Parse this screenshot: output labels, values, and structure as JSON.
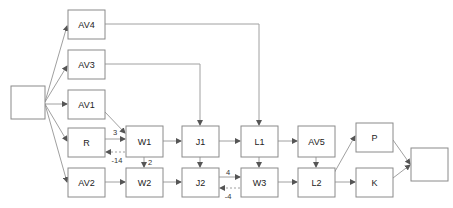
{
  "diagram": {
    "title": "",
    "canvas": {
      "width": 453,
      "height": 208
    },
    "style": {
      "box_fill": "#ffffff",
      "box_stroke": "#8a8a8a",
      "edge_stroke": "#a0a0a0",
      "label_color": "#222222",
      "edge_label_color": "#333333",
      "background": "#ffffff"
    },
    "nodes": [
      {
        "id": "SRC",
        "label": "",
        "x": 11,
        "y": 86,
        "w": 34,
        "h": 33
      },
      {
        "id": "AV4",
        "label": "AV4",
        "x": 68,
        "y": 10,
        "w": 37,
        "h": 29
      },
      {
        "id": "AV3",
        "label": "AV3",
        "x": 68,
        "y": 50,
        "w": 37,
        "h": 29
      },
      {
        "id": "AV1",
        "label": "AV1",
        "x": 68,
        "y": 90,
        "w": 37,
        "h": 29
      },
      {
        "id": "R",
        "label": "R",
        "x": 68,
        "y": 128,
        "w": 37,
        "h": 29
      },
      {
        "id": "AV2",
        "label": "AV2",
        "x": 68,
        "y": 168,
        "w": 37,
        "h": 29
      },
      {
        "id": "W1",
        "label": "W1",
        "x": 126,
        "y": 126,
        "w": 37,
        "h": 31
      },
      {
        "id": "W2",
        "label": "W2",
        "x": 126,
        "y": 168,
        "w": 37,
        "h": 29
      },
      {
        "id": "J1",
        "label": "J1",
        "x": 182,
        "y": 126,
        "w": 37,
        "h": 31
      },
      {
        "id": "J2",
        "label": "J2",
        "x": 182,
        "y": 168,
        "w": 37,
        "h": 29
      },
      {
        "id": "L1",
        "label": "L1",
        "x": 241,
        "y": 126,
        "w": 37,
        "h": 31
      },
      {
        "id": "W3",
        "label": "W3",
        "x": 241,
        "y": 168,
        "w": 37,
        "h": 29
      },
      {
        "id": "AV5",
        "label": "AV5",
        "x": 298,
        "y": 126,
        "w": 37,
        "h": 31
      },
      {
        "id": "L2",
        "label": "L2",
        "x": 298,
        "y": 168,
        "w": 37,
        "h": 29
      },
      {
        "id": "P",
        "label": "P",
        "x": 356,
        "y": 123,
        "w": 37,
        "h": 29
      },
      {
        "id": "K",
        "label": "K",
        "x": 356,
        "y": 168,
        "w": 37,
        "h": 29
      },
      {
        "id": "SINK",
        "label": "",
        "x": 411,
        "y": 148,
        "w": 37,
        "h": 33
      }
    ],
    "edges": [
      {
        "id": "e-src-av4",
        "from": "SRC",
        "to": "AV4",
        "label": "",
        "style": "solid",
        "points": "45,102 67,26"
      },
      {
        "id": "e-src-av3",
        "from": "SRC",
        "to": "AV3",
        "label": "",
        "style": "solid",
        "points": "45,102 67,66"
      },
      {
        "id": "e-src-av1",
        "from": "SRC",
        "to": "AV1",
        "label": "",
        "style": "solid",
        "points": "45,104 67,104"
      },
      {
        "id": "e-src-r",
        "from": "SRC",
        "to": "R",
        "label": "",
        "style": "solid",
        "points": "45,104 67,141"
      },
      {
        "id": "e-src-av2",
        "from": "SRC",
        "to": "AV2",
        "label": "",
        "style": "solid",
        "points": "45,104 67,182"
      },
      {
        "id": "e-av4-l1",
        "from": "AV4",
        "to": "L1",
        "label": "",
        "style": "solid",
        "points": "105,24 259,24 259,125"
      },
      {
        "id": "e-av3-j1",
        "from": "AV3",
        "to": "J1",
        "label": "",
        "style": "solid",
        "points": "105,64 200,64 200,125"
      },
      {
        "id": "e-av1-w1",
        "from": "AV1",
        "to": "W1",
        "label": "",
        "style": "solid",
        "points": "105,112 125,133"
      },
      {
        "id": "e-r-w1",
        "from": "R",
        "to": "W1",
        "label": "3",
        "style": "solid",
        "points": "105,139 125,139"
      },
      {
        "id": "e-w1-r",
        "from": "W1",
        "to": "R",
        "label": "-14",
        "style": "dashed",
        "points": "125,152 106,152"
      },
      {
        "id": "e-w1-w2",
        "from": "W1",
        "to": "W2",
        "label": "2",
        "style": "solid",
        "points": "144,157 144,167"
      },
      {
        "id": "e-av2-w2",
        "from": "AV2",
        "to": "W2",
        "label": "",
        "style": "solid",
        "points": "105,182 125,182"
      },
      {
        "id": "e-w1-j1",
        "from": "W1",
        "to": "J1",
        "label": "",
        "style": "solid",
        "points": "163,141 181,141"
      },
      {
        "id": "e-w2-j2",
        "from": "W2",
        "to": "J2",
        "label": "",
        "style": "solid",
        "points": "163,182 181,182"
      },
      {
        "id": "e-j1-j2",
        "from": "J1",
        "to": "J2",
        "label": "",
        "style": "solid",
        "points": "200,157 200,167"
      },
      {
        "id": "e-j1-l1",
        "from": "J1",
        "to": "L1",
        "label": "",
        "style": "solid",
        "points": "219,141 240,141"
      },
      {
        "id": "e-j2-w3",
        "from": "J2",
        "to": "W3",
        "label": "4",
        "style": "solid",
        "points": "219,177 240,177"
      },
      {
        "id": "e-w3-j2",
        "from": "W3",
        "to": "J2",
        "label": "-4",
        "style": "dashed",
        "points": "240,188 220,188"
      },
      {
        "id": "e-l1-w3",
        "from": "L1",
        "to": "W3",
        "label": "",
        "style": "solid",
        "points": "259,157 259,167"
      },
      {
        "id": "e-l1-av5",
        "from": "L1",
        "to": "AV5",
        "label": "",
        "style": "solid",
        "points": "278,141 297,141"
      },
      {
        "id": "e-w3-l2",
        "from": "W3",
        "to": "L2",
        "label": "",
        "style": "solid",
        "points": "278,182 297,182"
      },
      {
        "id": "e-av5-l2",
        "from": "AV5",
        "to": "L2",
        "label": "",
        "style": "solid",
        "points": "316,157 316,167"
      },
      {
        "id": "e-l2-p",
        "from": "L2",
        "to": "P",
        "label": "",
        "style": "solid",
        "points": "329,182 355,136"
      },
      {
        "id": "e-l2-k",
        "from": "L2",
        "to": "K",
        "label": "",
        "style": "solid",
        "points": "335,182 355,182"
      },
      {
        "id": "e-p-sink",
        "from": "P",
        "to": "SINK",
        "label": "",
        "style": "solid",
        "points": "393,140 410,164"
      },
      {
        "id": "e-k-sink",
        "from": "K",
        "to": "SINK",
        "label": "",
        "style": "solid",
        "points": "393,178 410,165"
      }
    ],
    "edge_labels": [
      {
        "id": "lbl-3",
        "text": "3",
        "x": 115,
        "y": 132
      },
      {
        "id": "lbl-m14",
        "text": "-14",
        "x": 117,
        "y": 160
      },
      {
        "id": "lbl-2",
        "text": "2",
        "x": 150,
        "y": 162
      },
      {
        "id": "lbl-4",
        "text": "4",
        "x": 228,
        "y": 172
      },
      {
        "id": "lbl-m4",
        "text": "-4",
        "x": 228,
        "y": 196
      }
    ]
  }
}
